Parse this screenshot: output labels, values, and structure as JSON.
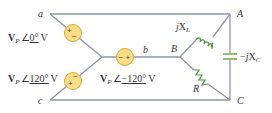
{
  "diagram": {
    "source_nodes": {
      "a": "a",
      "b": "b",
      "c": "c"
    },
    "load_nodes": {
      "A": "A",
      "B": "B",
      "C": "C"
    },
    "sources": [
      {
        "id": "Va",
        "magnitude": "V",
        "subscript": "P",
        "angle_symbol": "∠",
        "angle": "0°",
        "unit": "V",
        "polarity_top": "+",
        "polarity_bottom": "−"
      },
      {
        "id": "Vb",
        "magnitude": "V",
        "subscript": "P",
        "angle_symbol": "∠",
        "angle": "−120°",
        "unit": "V",
        "polarity_left": "−",
        "polarity_right": "+"
      },
      {
        "id": "Vc",
        "magnitude": "V",
        "subscript": "P",
        "angle_symbol": "∠",
        "angle": "120°",
        "unit": "V",
        "polarity_top": "−",
        "polarity_bottom": "+"
      }
    ],
    "components": {
      "inductor": {
        "label": "jX",
        "subscript": "L",
        "between": "A-B"
      },
      "capacitor": {
        "label": "−jX",
        "subscript": "C",
        "between": "A-C"
      },
      "resistor": {
        "label": "R",
        "between": "B-C"
      }
    },
    "colors": {
      "wire": "#8a96a8",
      "source_fill": "#f9dd86",
      "source_stroke": "#d9a93a",
      "component": "#4f9a3e",
      "capacitor": "#8fbf6e",
      "text": "#333333"
    }
  }
}
